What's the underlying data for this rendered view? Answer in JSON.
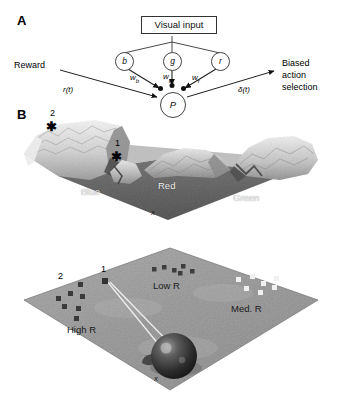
{
  "figure": {
    "panels": [
      {
        "id": "A",
        "letter": "A"
      },
      {
        "id": "B",
        "letter": "B"
      }
    ]
  },
  "panel_a": {
    "letter": "A",
    "visual_input": {
      "label": "Visual input"
    },
    "nodes": [
      {
        "name": "node-b",
        "label": "b"
      },
      {
        "name": "node-g",
        "label": "g"
      },
      {
        "name": "node-r",
        "label": "r"
      },
      {
        "name": "node-p",
        "label": "P"
      }
    ],
    "weights": [
      {
        "name": "weight-wb",
        "base": "w",
        "sub": "b"
      },
      {
        "name": "weight-wg",
        "base": "w",
        "sub": "g"
      },
      {
        "name": "weight-wr",
        "base": "w",
        "sub": "r"
      }
    ],
    "reward_label": "Reward",
    "reward_signal": "r(t)",
    "output_label_lines": [
      "Biased",
      "action",
      "selection"
    ],
    "output_signal": "δ(t)"
  },
  "panel_b": {
    "letter": "B",
    "top_scene": {
      "name": "reward-landscape-surface",
      "band_labels": [
        {
          "name": "band-label-blue",
          "text": "Blue"
        },
        {
          "name": "band-label-red",
          "text": "Red"
        },
        {
          "name": "band-label-green",
          "text": "Green"
        }
      ],
      "markers": [
        {
          "name": "marker-2",
          "number": "2",
          "glyph": "✳"
        },
        {
          "name": "marker-1",
          "number": "1",
          "glyph": "✳"
        }
      ],
      "axis_mark": "x"
    },
    "bottom_scene": {
      "name": "reward-arena-plane",
      "region_labels": [
        {
          "name": "region-label-high-r",
          "text": "High R"
        },
        {
          "name": "region-label-low-r",
          "text": "Low R"
        },
        {
          "name": "region-label-med-r",
          "text": "Med. R"
        }
      ],
      "markers": [
        {
          "name": "marker-2",
          "number": "2"
        },
        {
          "name": "marker-1",
          "number": "1"
        }
      ],
      "agent": {
        "name": "agent-sphere"
      },
      "axis_mark": "x"
    }
  },
  "colors": {
    "ink": "#000000",
    "surface_dark": "#5a5a5a",
    "surface_mid": "#8d8d8d",
    "surface_light": "#e8e8e8",
    "plane": "#9a9a9a"
  }
}
